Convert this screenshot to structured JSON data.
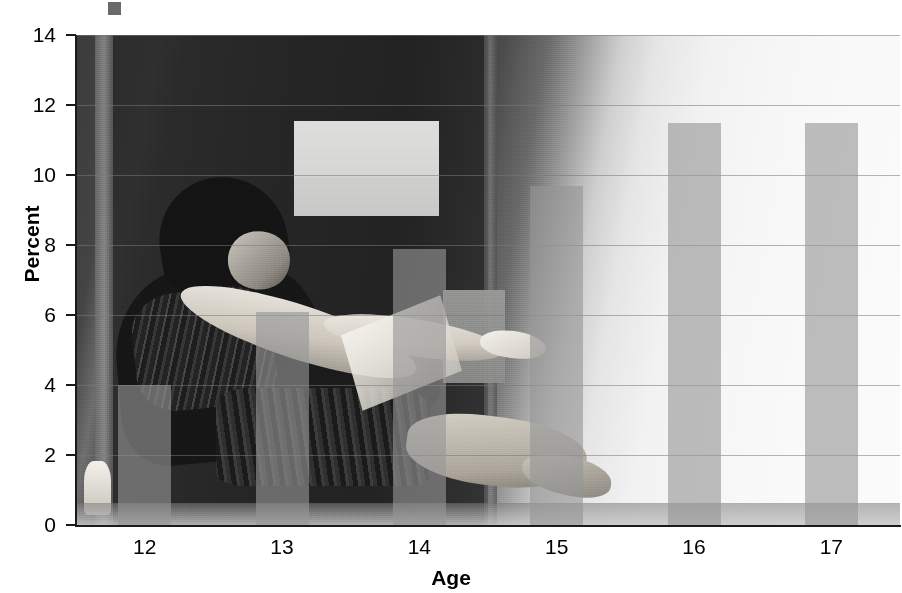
{
  "chart_data": {
    "type": "bar",
    "title": "",
    "subtitle": "",
    "xlabel": "Age",
    "ylabel": "Percent",
    "categories": [
      "12",
      "13",
      "14",
      "15",
      "16",
      "17"
    ],
    "values": [
      4.0,
      6.1,
      7.9,
      9.7,
      11.5,
      11.5
    ],
    "series": [
      {
        "name": "Percent",
        "values": [
          4.0,
          6.1,
          7.9,
          9.7,
          11.5,
          11.5
        ]
      }
    ],
    "ylim": [
      0,
      14
    ],
    "yticks": [
      0,
      2,
      4,
      6,
      8,
      10,
      12,
      14
    ],
    "ytick_labels": [
      "0",
      "2",
      "4",
      "6",
      "8",
      "10",
      "12",
      "14"
    ],
    "xtick_labels": [
      "12",
      "13",
      "14",
      "15",
      "16",
      "17"
    ],
    "grid": true,
    "grid_axis": "y",
    "legend": false,
    "legend_position": "none",
    "annotations": [],
    "bar_color": "#969696",
    "bar_opacity": 0.62,
    "axis_color": "#1a1a1a",
    "gridline_color": "#787878",
    "background": "photographic-overlay"
  },
  "figure": {
    "background_image_name": "person-seated-reading-photo",
    "background_description": "grayscale photograph of a seated person reading, used as the chart backdrop",
    "crop_artifact_name": "cropped-marker-square"
  },
  "axes": {
    "y": {
      "label": "Percent",
      "ticks": [
        {
          "value": 14,
          "label": "14"
        },
        {
          "value": 12,
          "label": "12"
        },
        {
          "value": 10,
          "label": "10"
        },
        {
          "value": 8,
          "label": "8"
        },
        {
          "value": 6,
          "label": "6"
        },
        {
          "value": 4,
          "label": "4"
        },
        {
          "value": 2,
          "label": "2"
        },
        {
          "value": 0,
          "label": "0"
        }
      ]
    },
    "x": {
      "label": "Age",
      "ticks": [
        {
          "value": "12",
          "label": "12"
        },
        {
          "value": "13",
          "label": "13"
        },
        {
          "value": "14",
          "label": "14"
        },
        {
          "value": "15",
          "label": "15"
        },
        {
          "value": "16",
          "label": "16"
        },
        {
          "value": "17",
          "label": "17"
        }
      ]
    }
  }
}
